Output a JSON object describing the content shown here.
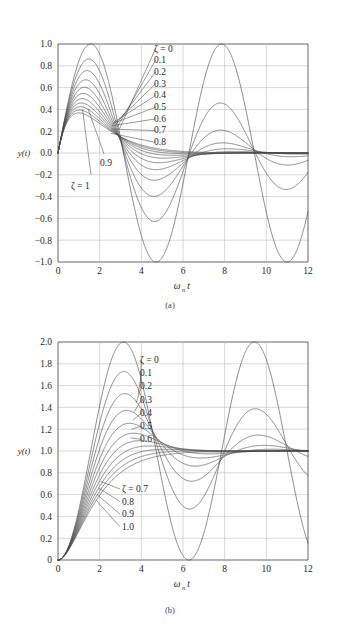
{
  "top_caption": "",
  "figures": [
    {
      "id": "figure-a",
      "caption": "(a)",
      "ylabel": "y(t)",
      "xlabel_main": "ω",
      "xlabel_sub": "n",
      "xlabel_tail": "t",
      "chart_data": {
        "type": "line",
        "title": "",
        "subtitle": "",
        "xlabel": "ωₙt",
        "ylabel": "y(t)",
        "xlim": [
          0,
          12
        ],
        "ylim": [
          -1.0,
          1.0
        ],
        "xticks": [
          "0",
          "2",
          "4",
          "6",
          "8",
          "10",
          "12"
        ],
        "xtick_values": [
          0,
          2,
          4,
          6,
          8,
          10,
          12
        ],
        "yticks": [
          "1.0",
          "0.8",
          "0.6",
          "0.4",
          "0.2",
          "0.0",
          "−0.2",
          "−0.4",
          "−0.6",
          "−0.8",
          "−1.0"
        ],
        "ytick_values": [
          1.0,
          0.8,
          0.6,
          0.4,
          0.2,
          0.0,
          -0.2,
          -0.4,
          -0.6,
          -0.8,
          -1.0
        ],
        "grid": true,
        "legend_position": "inline-annotations",
        "formula": "y = sin(sqrt(1-z^2)*x) * exp(-z*x) / sqrt(1-z^2)",
        "series": [
          {
            "name": "ζ = 0",
            "zeta": 0.0,
            "label": "ζ = 0"
          },
          {
            "name": "0.1",
            "zeta": 0.1,
            "label": "0.1"
          },
          {
            "name": "0.2",
            "zeta": 0.2,
            "label": "0.2"
          },
          {
            "name": "0.3",
            "zeta": 0.3,
            "label": "0.3"
          },
          {
            "name": "0.4",
            "zeta": 0.4,
            "label": "0.4"
          },
          {
            "name": "0.5",
            "zeta": 0.5,
            "label": "0.5"
          },
          {
            "name": "0.6",
            "zeta": 0.6,
            "label": "0.6"
          },
          {
            "name": "0.7",
            "zeta": 0.7,
            "label": "0.7"
          },
          {
            "name": "0.8",
            "zeta": 0.8,
            "label": "0.8"
          },
          {
            "name": "0.9",
            "zeta": 0.9,
            "label": "0.9"
          },
          {
            "name": "ζ = 1",
            "zeta": 1.0,
            "label": "ζ = 1"
          }
        ],
        "annotations": [
          {
            "text": "ζ = 0",
            "zeta": 0.0
          },
          {
            "text": "0.1",
            "zeta": 0.1
          },
          {
            "text": "0.2",
            "zeta": 0.2
          },
          {
            "text": "0.3",
            "zeta": 0.3
          },
          {
            "text": "0.4",
            "zeta": 0.4
          },
          {
            "text": "0.5",
            "zeta": 0.5
          },
          {
            "text": "0.6",
            "zeta": 0.6
          },
          {
            "text": "0.7",
            "zeta": 0.7
          },
          {
            "text": "0.8",
            "zeta": 0.8
          },
          {
            "text": "0.9",
            "zeta": 0.9
          },
          {
            "text": "ζ = 1",
            "zeta": 1.0
          }
        ]
      }
    },
    {
      "id": "figure-b",
      "caption": "(b)",
      "ylabel": "y(t)",
      "xlabel_main": "ω",
      "xlabel_sub": "n",
      "xlabel_tail": "t",
      "chart_data": {
        "type": "line",
        "title": "",
        "subtitle": "",
        "xlabel": "ωₙt",
        "ylabel": "y(t)",
        "xlim": [
          0,
          12
        ],
        "ylim": [
          0,
          2.0
        ],
        "xticks": [
          "0",
          "2",
          "4",
          "6",
          "8",
          "10",
          "12"
        ],
        "xtick_values": [
          0,
          2,
          4,
          6,
          8,
          10,
          12
        ],
        "yticks": [
          "2.0",
          "1.8",
          "1.6",
          "1.4",
          "1.2",
          "1.0",
          "0.8",
          "0.6",
          "0.4",
          "0.2",
          "0"
        ],
        "ytick_values": [
          2.0,
          1.8,
          1.6,
          1.4,
          1.2,
          1.0,
          0.8,
          0.6,
          0.4,
          0.2,
          0.0
        ],
        "grid": true,
        "legend_position": "inline-annotations",
        "formula": "y = 1 - exp(-z*x)*(cos(sqrt(1-z^2)*x) + z/sqrt(1-z^2)*sin(sqrt(1-z^2)*x))",
        "series": [
          {
            "name": "ζ = 0",
            "zeta": 0.0,
            "label": "ζ = 0"
          },
          {
            "name": "0.1",
            "zeta": 0.1,
            "label": "0.1"
          },
          {
            "name": "0.2",
            "zeta": 0.2,
            "label": "0.2"
          },
          {
            "name": "0.3",
            "zeta": 0.3,
            "label": "0.3"
          },
          {
            "name": "0.4",
            "zeta": 0.4,
            "label": "0.4"
          },
          {
            "name": "0.5",
            "zeta": 0.5,
            "label": "0.5"
          },
          {
            "name": "0.6",
            "zeta": 0.6,
            "label": "0.6"
          },
          {
            "name": "ζ = 0.7",
            "zeta": 0.7,
            "label": "ζ = 0.7"
          },
          {
            "name": "0.8",
            "zeta": 0.8,
            "label": "0.8"
          },
          {
            "name": "0.9",
            "zeta": 0.9,
            "label": "0.9"
          },
          {
            "name": "1.0",
            "zeta": 1.0,
            "label": "1.0"
          }
        ],
        "annotations": [
          {
            "text": "ζ = 0",
            "zeta": 0.0
          },
          {
            "text": "0.1",
            "zeta": 0.1
          },
          {
            "text": "0.2",
            "zeta": 0.2
          },
          {
            "text": "0.3",
            "zeta": 0.3
          },
          {
            "text": "0.4",
            "zeta": 0.4
          },
          {
            "text": "0.5",
            "zeta": 0.5
          },
          {
            "text": "0.6",
            "zeta": 0.6
          },
          {
            "text": "ζ = 0.7",
            "zeta": 0.7
          },
          {
            "text": "0.8",
            "zeta": 0.8
          },
          {
            "text": "0.9",
            "zeta": 0.9
          },
          {
            "text": "1.0",
            "zeta": 1.0
          }
        ]
      }
    }
  ],
  "colors": {
    "curve": "#4a4a4a",
    "axis": "#555555",
    "grid": "#bdbdbd",
    "text": "#1f1f1f",
    "background": "#ffffff"
  }
}
